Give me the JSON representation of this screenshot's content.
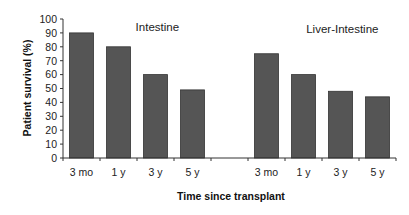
{
  "chart_data": {
    "type": "bar",
    "ylabel": "Patient survival (%)",
    "xlabel": "Time since transplant",
    "ylim": [
      0,
      100
    ],
    "yticks": [
      0,
      10,
      20,
      30,
      40,
      50,
      60,
      70,
      80,
      90,
      100
    ],
    "grid": false,
    "legend": "none",
    "bar_color": "#555555",
    "groups": [
      {
        "title": "Intestine",
        "categories": [
          "3 mo",
          "1 y",
          "3 y",
          "5 y"
        ],
        "values": [
          90,
          80,
          60,
          49
        ]
      },
      {
        "title": "Liver-Intestine",
        "categories": [
          "3 mo",
          "1 y",
          "3 y",
          "5 y"
        ],
        "values": [
          75,
          60,
          48,
          44
        ]
      }
    ]
  }
}
